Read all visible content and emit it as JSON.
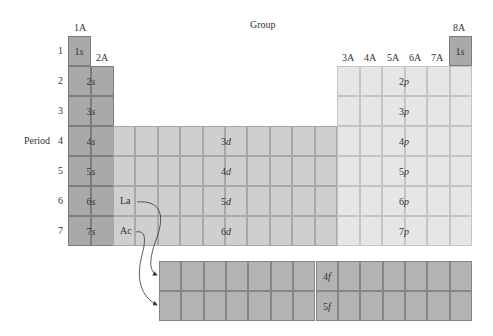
{
  "title": "Group",
  "axis": {
    "period_label": "Period"
  },
  "group_labels": {
    "g1": "1A",
    "g2": "2A",
    "g13": "3A",
    "g14": "4A",
    "g15": "5A",
    "g16": "6A",
    "g17": "7A",
    "g18": "8A"
  },
  "periods": [
    "1",
    "2",
    "3",
    "4",
    "5",
    "6",
    "7"
  ],
  "blocks": {
    "s": {
      "orbitals": [
        {
          "n": "1",
          "l": "s"
        },
        {
          "n": "2",
          "l": "s"
        },
        {
          "n": "3",
          "l": "s"
        },
        {
          "n": "4",
          "l": "s"
        },
        {
          "n": "5",
          "l": "s"
        },
        {
          "n": "6",
          "l": "s"
        },
        {
          "n": "7",
          "l": "s"
        }
      ],
      "he": {
        "n": "1",
        "l": "s"
      },
      "color": "#a9a9a9"
    },
    "d": {
      "orbitals": [
        {
          "n": "3",
          "l": "d"
        },
        {
          "n": "4",
          "l": "d"
        },
        {
          "n": "5",
          "l": "d"
        },
        {
          "n": "6",
          "l": "d"
        }
      ],
      "color": "#cfcfcf"
    },
    "p": {
      "orbitals": [
        {
          "n": "2",
          "l": "p"
        },
        {
          "n": "3",
          "l": "p"
        },
        {
          "n": "4",
          "l": "p"
        },
        {
          "n": "5",
          "l": "p"
        },
        {
          "n": "6",
          "l": "p"
        },
        {
          "n": "7",
          "l": "p"
        }
      ],
      "color": "#e6e6e6"
    },
    "f": {
      "orbitals": [
        {
          "n": "4",
          "l": "f"
        },
        {
          "n": "5",
          "l": "f"
        }
      ],
      "color": "#b3b3b3"
    }
  },
  "elements": {
    "la": "La",
    "ac": "Ac"
  }
}
